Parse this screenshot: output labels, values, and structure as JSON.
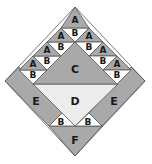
{
  "diagram": {
    "type": "quilt-block-piecing-diagram",
    "colors": {
      "dark": "#a9a9a9",
      "light": "#ffffff",
      "medium_light": "#ececec",
      "stroke": "#555555"
    },
    "labels": {
      "A": "A",
      "B": "B",
      "C": "C",
      "D": "D",
      "E": "E",
      "F": "F"
    },
    "pieces": [
      {
        "id": "A",
        "count": 7,
        "fill": "dark"
      },
      {
        "id": "B",
        "count": 9,
        "fill": "light"
      },
      {
        "id": "C",
        "count": 1,
        "fill": "dark"
      },
      {
        "id": "D",
        "count": 1,
        "fill": "medium_light"
      },
      {
        "id": "E",
        "count": 2,
        "fill": "dark"
      },
      {
        "id": "F",
        "count": 1,
        "fill": "dark"
      }
    ]
  }
}
